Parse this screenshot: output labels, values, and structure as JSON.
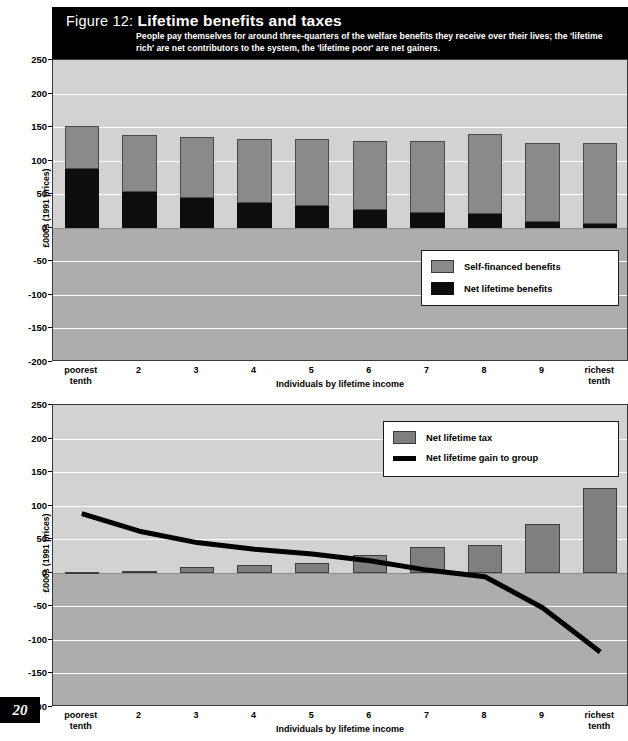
{
  "figure": {
    "prefix": "Figure 12:",
    "title": "Lifetime benefits and taxes",
    "subtitle": "People pay themselves for  around three-quarters of the welfare benefits they receive over their lives; the 'lifetime rich' are net contributors to the system, the 'lifetime poor' are net gainers."
  },
  "page": {
    "number": "20"
  },
  "colors": {
    "self_financed": "#8a8a8a",
    "net_benefits": "#0d0d0d",
    "net_tax": "#7f7f7f",
    "net_gain_line": "#000000",
    "plot_positive_bg": "#d2d2d2",
    "plot_negative_bg": "#adadad",
    "gridline": "#ffffff",
    "title_bar_bg": "#000000"
  },
  "chart_data": [
    {
      "type": "bar",
      "id": "benefits",
      "title": "Lifetime benefits and taxes",
      "stacked": true,
      "categories": [
        "poorest\ntenth",
        "2",
        "3",
        "4",
        "5",
        "6",
        "7",
        "8",
        "9",
        "richest\ntenth"
      ],
      "category_labels": [
        "poorest tenth",
        "2",
        "3",
        "4",
        "5",
        "6",
        "7",
        "8",
        "9",
        "richest tenth"
      ],
      "series": [
        {
          "name": "Net lifetime benefits",
          "values": [
            88,
            53,
            45,
            37,
            32,
            26,
            22,
            21,
            8,
            5
          ]
        },
        {
          "name": "Self-financed benefits",
          "values": [
            64,
            85,
            90,
            96,
            101,
            104,
            108,
            118,
            118,
            121
          ]
        }
      ],
      "totals": [
        152,
        138,
        135,
        133,
        133,
        130,
        130,
        139,
        126,
        126
      ],
      "xlabel": "Individuals by lifetime income",
      "ylabel": "£000s (1991 prices)",
      "ylim": [
        -200,
        250
      ],
      "yticks": [
        250,
        200,
        150,
        100,
        50,
        0,
        -50,
        -100,
        -150,
        -200
      ],
      "grid": true,
      "legend_position": "inside-right",
      "legend": [
        "Self-financed benefits",
        "Net lifetime benefits"
      ]
    },
    {
      "type": "bar",
      "id": "taxes",
      "title": "Net lifetime tax and net lifetime gain",
      "categories": [
        "poorest\ntenth",
        "2",
        "3",
        "4",
        "5",
        "6",
        "7",
        "8",
        "9",
        "richest\ntenth"
      ],
      "category_labels": [
        "poorest tenth",
        "2",
        "3",
        "4",
        "5",
        "6",
        "7",
        "8",
        "9",
        "richest tenth"
      ],
      "series": [
        {
          "name": "Net lifetime tax",
          "type": "bar",
          "values": [
            1,
            2,
            9,
            11,
            15,
            27,
            38,
            42,
            73,
            127
          ]
        },
        {
          "name": "Net lifetime gain to group",
          "type": "line",
          "values": [
            88,
            62,
            45,
            35,
            28,
            18,
            4,
            -6,
            -52,
            -118
          ]
        }
      ],
      "xlabel": "Individuals by lifetime income",
      "ylabel": "£000s (1991 prices)",
      "ylim": [
        -200,
        250
      ],
      "yticks": [
        250,
        200,
        150,
        100,
        50,
        0,
        -50,
        -100,
        -150,
        -200
      ],
      "grid": true,
      "legend_position": "inside-right",
      "legend": [
        "Net lifetime tax",
        "Net lifetime gain to group"
      ]
    }
  ]
}
